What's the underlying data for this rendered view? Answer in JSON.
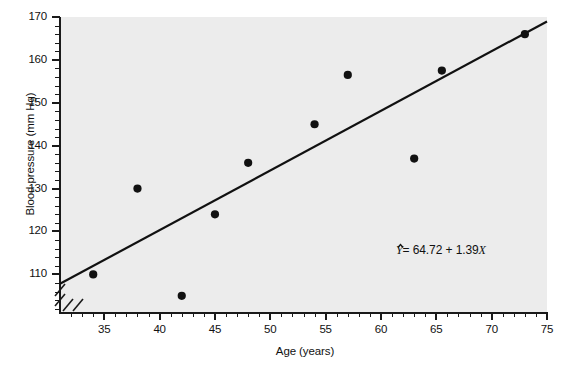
{
  "chart_data": {
    "type": "scatter",
    "title": "",
    "xlabel": "Age (years)",
    "ylabel": "Blood pressure (mm Hg)",
    "xlim": [
      31,
      75
    ],
    "ylim": [
      101,
      170
    ],
    "xticks": [
      35,
      40,
      45,
      50,
      55,
      60,
      65,
      70,
      75
    ],
    "yticks": [
      110,
      120,
      130,
      140,
      150,
      160,
      170
    ],
    "xtick_labels": [
      "35",
      "40",
      "45",
      "50",
      "55",
      "60",
      "65",
      "70",
      "75"
    ],
    "ytick_labels": [
      "110",
      "120",
      "130",
      "140",
      "150",
      "160",
      "170"
    ],
    "x_minor_step": 1,
    "y_minor_step": 2,
    "grid": false,
    "legend": "none",
    "axis_breaks": {
      "x": true,
      "y": true
    },
    "x": [
      34,
      38,
      42,
      45,
      48,
      54,
      57,
      63,
      65.5,
      73
    ],
    "y": [
      110,
      130,
      105,
      124,
      136,
      145,
      156.5,
      137,
      157.5,
      166
    ],
    "points": [
      {
        "x": 34,
        "y": 110.0
      },
      {
        "x": 38,
        "y": 130.0
      },
      {
        "x": 42,
        "y": 105.0
      },
      {
        "x": 45,
        "y": 124.0
      },
      {
        "x": 48,
        "y": 136.0
      },
      {
        "x": 54,
        "y": 145.0
      },
      {
        "x": 57,
        "y": 156.5
      },
      {
        "x": 63,
        "y": 137.0
      },
      {
        "x": 65.5,
        "y": 157.5
      },
      {
        "x": 73,
        "y": 166.0
      }
    ],
    "regression": {
      "intercept": 64.72,
      "slope": 1.39,
      "equation_text": "Y = 64.72 + 1.39X",
      "equation_lhs": "Y",
      "equation_rhs": "= 64.72 + 1.39",
      "equation_var": "X",
      "hat": true
    },
    "marker": {
      "shape": "circle",
      "color": "#111111",
      "size": 7
    },
    "line": {
      "color": "#111111",
      "width": 2.2
    },
    "panel_color": "#ececec",
    "axis_color": "#1a1a1a"
  },
  "annotations": {
    "equation": "Ŷ = 64.72 + 1.39X"
  }
}
